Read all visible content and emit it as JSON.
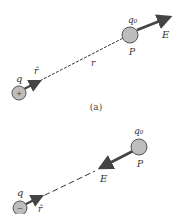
{
  "panel_a": {
    "caption": "(a)",
    "source_charge_label": "q",
    "source_charge_sign": "+",
    "unit_vector_label": "r̂",
    "distance_label": "r",
    "test_charge_label": "q₀",
    "point_label": "P",
    "field_label": "E"
  },
  "panel_b": {
    "source_charge_label": "q",
    "source_charge_sign": "−",
    "unit_vector_label": "r̂",
    "test_charge_label": "q₀",
    "point_label": "P",
    "field_label": "E"
  },
  "colors": {
    "charge_fill": "#bdbdbd",
    "arrow": "#444444",
    "line": "#333333"
  }
}
